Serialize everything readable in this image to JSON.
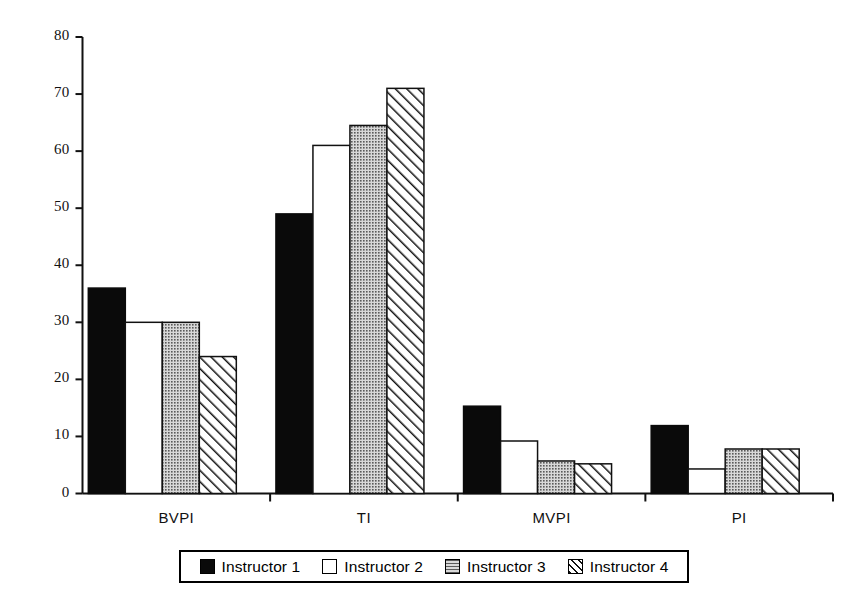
{
  "chart_data": {
    "type": "bar",
    "title": "",
    "xlabel": "",
    "ylabel": "",
    "categories": [
      "BVPI",
      "TI",
      "MVPI",
      "PI"
    ],
    "series": [
      {
        "name": "Instructor 1",
        "fill": "solid-black",
        "color": "#0a0a0a",
        "values": [
          36,
          49,
          15.3,
          11.9
        ]
      },
      {
        "name": "Instructor 2",
        "fill": "white-outline",
        "color": "#ffffff",
        "values": [
          30,
          61,
          9.2,
          4.3
        ]
      },
      {
        "name": "Instructor 3",
        "fill": "gray-stipple",
        "color": "#9a9a9a",
        "values": [
          30,
          64.5,
          5.7,
          7.8
        ]
      },
      {
        "name": "Instructor 4",
        "fill": "diagonal-hatch",
        "color": "#ffffff",
        "values": [
          24,
          71,
          5.2,
          7.8
        ]
      }
    ],
    "ylim": [
      0,
      80
    ],
    "yticks": [
      0,
      10,
      20,
      30,
      40,
      50,
      60,
      70,
      80
    ],
    "ytick_labels": [
      "0",
      "10",
      "20",
      "30",
      "40",
      "50",
      "60",
      "70",
      "80"
    ],
    "grid": false,
    "legend_position": "bottom"
  },
  "legend": {
    "entries": [
      "Instructor 1",
      "Instructor 2",
      "Instructor 3",
      "Instructor 4"
    ]
  },
  "axis": {
    "y_max_label": "80",
    "y_min_label": "0"
  }
}
